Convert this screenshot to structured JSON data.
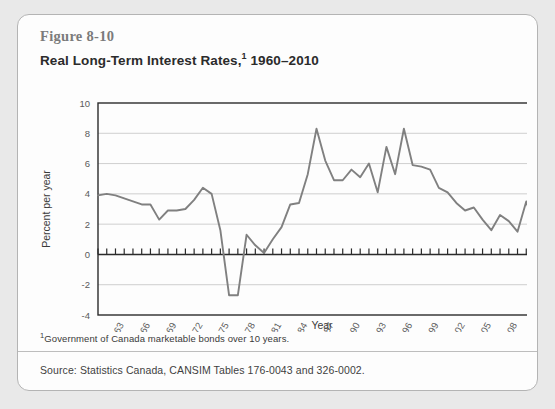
{
  "figure": {
    "number": "Figure 8-10",
    "title_main": "Real Long-Term Interest Rates,",
    "title_footnote_mark": "1",
    "title_years": " 1960–2010"
  },
  "footnote": {
    "mark": "1",
    "text": "Government of Canada marketable bonds over 10 years."
  },
  "source": {
    "text": "Source: Statistics Canada, CANSIM Tables 176-0043 and 326-0002."
  },
  "colors": {
    "line": "#808080",
    "grid": "#cfcfcf",
    "frame": "#2b2b2b",
    "card_bg": "#fdfdfd",
    "page_bg": "#e9e9e9",
    "card_border": "#b4b4b4",
    "tick_text": "#5a5a5a"
  },
  "chart_data": {
    "type": "line",
    "xlabel": "Year",
    "ylabel": "Percent per year",
    "xlim": [
      1960,
      2010
    ],
    "ylim": [
      -4,
      10
    ],
    "ytick_values": [
      -4,
      -2,
      0,
      2,
      4,
      6,
      8,
      10
    ],
    "ytick_labels": [
      "-4",
      "-2",
      "0",
      "2",
      "4",
      "6",
      "8",
      "10"
    ],
    "xtick_values": [
      1963,
      1966,
      1969,
      1972,
      1975,
      1978,
      1981,
      1984,
      1987,
      1990,
      1993,
      1996,
      1999,
      2002,
      2005,
      2008
    ],
    "xtick_labels": [
      "1963",
      "1966",
      "1969",
      "1972",
      "1975",
      "1978",
      "1981",
      "1984",
      "1987",
      "1990",
      "1993",
      "1996",
      "1999",
      "2002",
      "2005",
      "2008"
    ],
    "grid": "horizontal",
    "legend": "none",
    "zero_line_ticks": true,
    "series": [
      {
        "name": "Real long-term interest rate",
        "x": [
          1960,
          1961,
          1962,
          1963,
          1964,
          1965,
          1966,
          1967,
          1968,
          1969,
          1970,
          1971,
          1972,
          1973,
          1974,
          1975,
          1976,
          1977,
          1978,
          1979,
          1980,
          1981,
          1982,
          1983,
          1984,
          1985,
          1986,
          1987,
          1988,
          1989,
          1990,
          1991,
          1992,
          1993,
          1994,
          1995,
          1996,
          1997,
          1998,
          1999,
          2000,
          2001,
          2002,
          2003,
          2004,
          2005,
          2006,
          2007,
          2008,
          2009,
          2010
        ],
        "values": [
          3.9,
          4.0,
          3.9,
          3.7,
          3.5,
          3.3,
          3.3,
          2.3,
          2.9,
          2.9,
          3.0,
          3.6,
          4.4,
          4.0,
          1.6,
          -2.7,
          -2.7,
          1.3,
          0.6,
          0.1,
          1.0,
          1.8,
          3.3,
          3.4,
          5.3,
          8.3,
          6.2,
          4.9,
          4.9,
          5.6,
          5.1,
          6.0,
          4.1,
          7.1,
          5.3,
          8.3,
          5.9,
          5.8,
          5.6,
          4.4,
          4.1,
          3.4,
          2.9,
          3.1,
          2.3,
          1.6,
          2.6,
          2.2,
          1.5,
          3.5,
          1.7
        ]
      }
    ]
  }
}
